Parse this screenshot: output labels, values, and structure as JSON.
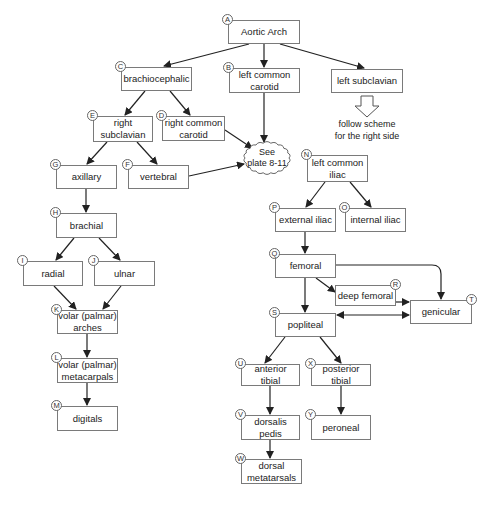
{
  "diagram": {
    "nodes": [
      {
        "id": "A",
        "label": "Aortic Arch",
        "x": 228,
        "y": 20,
        "w": 72,
        "h": 24
      },
      {
        "id": "B",
        "label": "left common\ncarotid",
        "x": 229,
        "y": 68,
        "w": 71,
        "h": 25
      },
      {
        "id": "C",
        "label": "brachiocephalic",
        "x": 121,
        "y": 67,
        "w": 71,
        "h": 24
      },
      {
        "id": "",
        "label": "left subclavian",
        "x": 331,
        "y": 69,
        "w": 72,
        "h": 24
      },
      {
        "id": "D",
        "label": "right common\ncarotid",
        "x": 162,
        "y": 116,
        "w": 63,
        "h": 25
      },
      {
        "id": "E",
        "label": "right\nsubclavian",
        "x": 93,
        "y": 116,
        "w": 60,
        "h": 26
      },
      {
        "id": "F",
        "label": "vertebral",
        "x": 128,
        "y": 165,
        "w": 61,
        "h": 24
      },
      {
        "id": "G",
        "label": "axillary",
        "x": 56,
        "y": 165,
        "w": 61,
        "h": 24
      },
      {
        "id": "H",
        "label": "brachial",
        "x": 56,
        "y": 213,
        "w": 61,
        "h": 25
      },
      {
        "id": "I",
        "label": "radial",
        "x": 23,
        "y": 261,
        "w": 60,
        "h": 25
      },
      {
        "id": "J",
        "label": "ulnar",
        "x": 94,
        "y": 261,
        "w": 61,
        "h": 25
      },
      {
        "id": "K",
        "label": "volar (palmar)\narches",
        "x": 57,
        "y": 310,
        "w": 61,
        "h": 24
      },
      {
        "id": "L",
        "label": "volar (palmar)\nmetacarpals",
        "x": 57,
        "y": 358,
        "w": 61,
        "h": 25
      },
      {
        "id": "M",
        "label": "digitals",
        "x": 57,
        "y": 406,
        "w": 61,
        "h": 25
      },
      {
        "id": "N",
        "label": "left common\niliac",
        "x": 307,
        "y": 155,
        "w": 61,
        "h": 27
      },
      {
        "id": "P",
        "label": "external iliac",
        "x": 275,
        "y": 208,
        "w": 61,
        "h": 24
      },
      {
        "id": "O",
        "label": "internal iliac",
        "x": 345,
        "y": 208,
        "w": 61,
        "h": 24
      },
      {
        "id": "Q",
        "label": "femoral",
        "x": 275,
        "y": 254,
        "w": 61,
        "h": 24
      },
      {
        "id": "R",
        "label": "deep femoral",
        "x": 335,
        "y": 285,
        "w": 61,
        "h": 21
      },
      {
        "id": "T",
        "label": "genicular",
        "x": 410,
        "y": 300,
        "w": 62,
        "h": 24
      },
      {
        "id": "S",
        "label": "popliteal",
        "x": 275,
        "y": 313,
        "w": 61,
        "h": 24
      },
      {
        "id": "U",
        "label": "anterior\ntibial",
        "x": 241,
        "y": 364,
        "w": 59,
        "h": 22
      },
      {
        "id": "X",
        "label": "posterior\ntibial",
        "x": 311,
        "y": 364,
        "w": 60,
        "h": 22
      },
      {
        "id": "V",
        "label": "dorsalis\npedis",
        "x": 241,
        "y": 415,
        "w": 59,
        "h": 25
      },
      {
        "id": "Y",
        "label": "peroneal",
        "x": 311,
        "y": 415,
        "w": 60,
        "h": 25
      },
      {
        "id": "W",
        "label": "dorsal\nmetatarsals",
        "x": 241,
        "y": 459,
        "w": 61,
        "h": 25
      }
    ],
    "cloud": {
      "label": "See\nplate 8-11",
      "cx": 267,
      "cy": 158,
      "rx": 22,
      "ry": 15
    },
    "note": {
      "label": "follow scheme\nfor the right side",
      "x": 327,
      "y": 118,
      "w": 80
    },
    "hollow_arrow": {
      "cx": 367,
      "top": 96,
      "bottom": 117
    },
    "edges": [
      {
        "from": [
          249,
          44
        ],
        "to": [
          164,
          66
        ]
      },
      {
        "from": [
          264,
          44
        ],
        "to": [
          264,
          67
        ]
      },
      {
        "from": [
          280,
          44
        ],
        "to": [
          364,
          68
        ]
      },
      {
        "from": [
          145,
          91
        ],
        "to": [
          125,
          115
        ]
      },
      {
        "from": [
          170,
          91
        ],
        "to": [
          190,
          115
        ]
      },
      {
        "from": [
          264,
          93
        ],
        "to": [
          264,
          142
        ]
      },
      {
        "from": [
          225,
          130
        ],
        "to": [
          252,
          148
        ]
      },
      {
        "from": [
          107,
          142
        ],
        "to": [
          87,
          164
        ]
      },
      {
        "from": [
          137,
          142
        ],
        "to": [
          157,
          164
        ]
      },
      {
        "from": [
          189,
          176
        ],
        "to": [
          244,
          164
        ]
      },
      {
        "from": [
          86,
          189
        ],
        "to": [
          86,
          212
        ]
      },
      {
        "from": [
          74,
          238
        ],
        "to": [
          56,
          260
        ]
      },
      {
        "from": [
          99,
          238
        ],
        "to": [
          120,
          260
        ]
      },
      {
        "from": [
          54,
          286
        ],
        "to": [
          76,
          309
        ]
      },
      {
        "from": [
          121,
          286
        ],
        "to": [
          103,
          309
        ]
      },
      {
        "from": [
          87,
          334
        ],
        "to": [
          87,
          357
        ]
      },
      {
        "from": [
          87,
          383
        ],
        "to": [
          87,
          405
        ]
      },
      {
        "from": [
          325,
          182
        ],
        "to": [
          306,
          207
        ]
      },
      {
        "from": [
          350,
          182
        ],
        "to": [
          371,
          207
        ]
      },
      {
        "from": [
          305,
          232
        ],
        "to": [
          305,
          253
        ]
      },
      {
        "from": [
          305,
          278
        ],
        "to": [
          305,
          312
        ]
      },
      {
        "from": [
          316,
          278
        ],
        "to": [
          335,
          292
        ]
      },
      {
        "from": [
          396,
          302
        ],
        "to": [
          409,
          302
        ]
      },
      {
        "from": [
          285,
          337
        ],
        "to": [
          265,
          363
        ]
      },
      {
        "from": [
          320,
          337
        ],
        "to": [
          341,
          363
        ]
      },
      {
        "from": [
          270,
          386
        ],
        "to": [
          270,
          414
        ]
      },
      {
        "from": [
          341,
          386
        ],
        "to": [
          341,
          414
        ]
      },
      {
        "from": [
          270,
          440
        ],
        "to": [
          270,
          458
        ]
      }
    ],
    "curved_edge": {
      "path": "M336,265 L432,265 Q441,265 441,274 L441,299"
    },
    "double_edge": {
      "from": [
        337,
        315
      ],
      "to": [
        409,
        315
      ]
    }
  }
}
